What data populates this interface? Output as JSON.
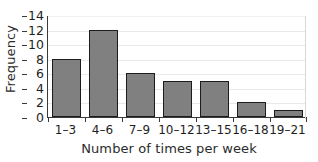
{
  "chart_data": {
    "type": "bar",
    "title": "",
    "xlabel": "Number of times per week",
    "ylabel": "Frequency",
    "categories": [
      "1–3",
      "4–6",
      "7–9",
      "10–12",
      "13–15",
      "16–18",
      "19–21"
    ],
    "values": [
      8,
      12,
      6,
      5,
      5,
      2,
      1
    ],
    "ylim": [
      0,
      14
    ],
    "yticks": [
      0,
      2,
      4,
      6,
      8,
      10,
      12,
      14
    ],
    "ytick_labels": [
      "0",
      "2",
      "4",
      "6",
      "8",
      "10",
      "12",
      "14"
    ],
    "grid": "horizontal",
    "legend": "none",
    "colors": {
      "bar_fill": "#808080",
      "bar_edge": "#1c1c1c",
      "gridline": "#e9e9e9",
      "axis": "#3a3a3a",
      "text": "#1e1e1e",
      "background": "#ffffff"
    }
  }
}
